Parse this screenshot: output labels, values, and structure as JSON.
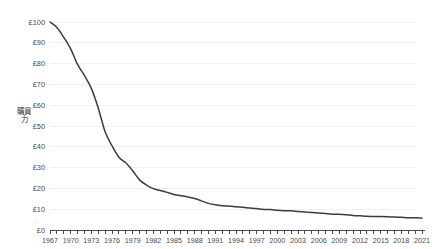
{
  "chart_data": {
    "type": "line",
    "title": "",
    "subtitle": "",
    "xlabel": "",
    "ylabel": "購買力",
    "ylim": [
      0,
      100
    ],
    "xlim": [
      1967,
      2021
    ],
    "grid": true,
    "grid_axis": "y",
    "legend": false,
    "legend_position": "none",
    "currency_symbol": "£",
    "y_ticks": [
      0,
      10,
      20,
      30,
      40,
      50,
      60,
      70,
      80,
      90,
      100
    ],
    "y_tick_labels": [
      "£0",
      "£10",
      "£20",
      "£30",
      "£40",
      "£50",
      "£60",
      "£70",
      "£80",
      "£90",
      "£100"
    ],
    "x_tick_labels": [
      "1967",
      "1970",
      "1973",
      "1976",
      "1979",
      "1982",
      "1985",
      "1988",
      "1991",
      "1994",
      "1997",
      "2000",
      "2003",
      "2006",
      "2009",
      "2012",
      "2015",
      "2018",
      "2021"
    ],
    "x_tick_label_interval": 3,
    "x_minor_tick_interval": 1,
    "line_color": "#3c3c3c",
    "grid_color": "#f0f0f0",
    "axis_color": "#4a4a4a",
    "x": [
      1967,
      1968,
      1969,
      1970,
      1971,
      1972,
      1973,
      1974,
      1975,
      1976,
      1977,
      1978,
      1979,
      1980,
      1981,
      1982,
      1983,
      1984,
      1985,
      1986,
      1987,
      1988,
      1989,
      1990,
      1991,
      1992,
      1993,
      1994,
      1995,
      1996,
      1997,
      1998,
      1999,
      2000,
      2001,
      2002,
      2003,
      2004,
      2005,
      2006,
      2007,
      2008,
      2009,
      2010,
      2011,
      2012,
      2013,
      2014,
      2015,
      2016,
      2017,
      2018,
      2019,
      2020,
      2021
    ],
    "series": [
      {
        "name": "購買力",
        "values": [
          100.0,
          97.3,
          92.6,
          87.1,
          79.6,
          74.3,
          68.1,
          58.7,
          47.2,
          40.5,
          35.0,
          32.3,
          28.5,
          24.1,
          21.6,
          19.9,
          19.0,
          18.1,
          17.1,
          16.5,
          15.9,
          15.1,
          14.0,
          12.8,
          12.1,
          11.7,
          11.5,
          11.2,
          10.9,
          10.6,
          10.3,
          9.9,
          9.8,
          9.5,
          9.3,
          9.2,
          8.9,
          8.7,
          8.4,
          8.2,
          7.9,
          7.6,
          7.6,
          7.3,
          7.0,
          6.8,
          6.6,
          6.5,
          6.5,
          6.4,
          6.2,
          6.1,
          5.9,
          5.9,
          5.7
        ]
      }
    ]
  }
}
